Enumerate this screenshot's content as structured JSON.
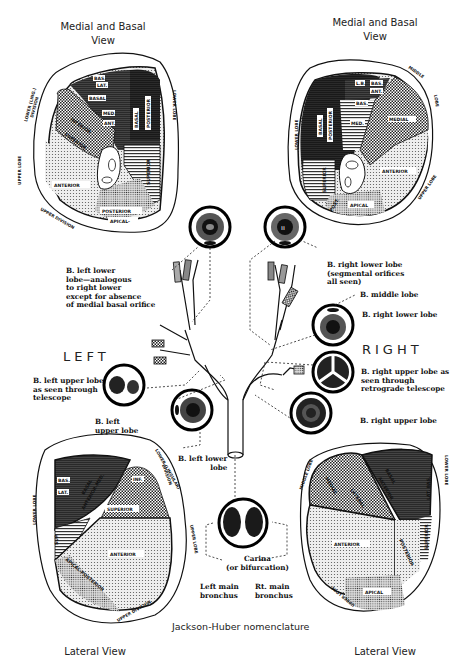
{
  "diagram": {
    "type": "anatomical-illustration",
    "nomenclature_label": "Jackson-Huber nomenclature",
    "sides": {
      "left": "LEFT",
      "right": "RIGHT"
    }
  },
  "panels": {
    "top_left": {
      "title_line1": "Medial and Basal",
      "title_line2": "View",
      "lobe_labels": [
        "LOWER (LING.) DIVISION",
        "UPPER LOBE",
        "LOWER LOBE",
        "UPPER DIVISION"
      ],
      "segments": [
        "BAS.",
        "LAT.",
        "BASAL",
        "MED.",
        "ANT.",
        "BASAL POSTERIOR",
        "INFERIOR",
        "SUPERIOR",
        "SUPERIOR",
        "ANTERIOR",
        "POSTERIOR",
        "APICAL-"
      ]
    },
    "top_right": {
      "title_line1": "Medial and Basal",
      "title_line2": "View",
      "lobe_labels": [
        "LOWER LOBE",
        "MIDDLE LOBE",
        "UPPER LOBE"
      ],
      "segments": [
        "L.B.",
        "BAS.",
        "ANT.",
        "BAS.",
        "MED.",
        "BASAL POSTERIOR",
        "MEDIAL",
        "SUPERIOR",
        "ANTERIOR",
        "POST.",
        "APICAL"
      ]
    },
    "bottom_left": {
      "title": "Lateral View",
      "lobe_labels": [
        "LOWER LOBE",
        "LOWER (LINGULAR) DIVISION",
        "UPPER LOBE",
        "UPPER DIVISION"
      ],
      "segments": [
        "BAS.",
        "LAT.",
        "BASAL ANTERIOR-MED.",
        "INF.",
        "SUPERIOR",
        "SUP.",
        "ANTERIOR",
        "APICAL-POSTERIOR"
      ]
    },
    "bottom_right": {
      "title": "Lateral View",
      "lobe_labels": [
        "MIDDLE LOBE",
        "LOWER LOBE",
        "UPPER LOBE"
      ],
      "segments": [
        "MEDIAL",
        "LATERAL",
        "BASAL ANTERIOR",
        "LAT. BAS.",
        "SUPERIOR",
        "ANTERIOR",
        "POSTERIOR",
        "APICAL"
      ]
    }
  },
  "captions": {
    "left_lower": [
      "B. left lower",
      "lobe—analogous",
      "to right lower",
      "except for absence",
      "of medial basal orifice"
    ],
    "right_lower_top": [
      "B. right lower lobe",
      "(segmental orifices",
      "all seen)"
    ],
    "middle_lobe": "B. middle lobe",
    "right_lower": "B. right lower lobe",
    "right_upper_retro": [
      "B. right upper lobe as",
      "seen through",
      "retrograde telescope"
    ],
    "left_upper_telescope": [
      "B. left upper lobe",
      "as seen through",
      "telescope"
    ],
    "left_upper": [
      "B. left",
      "upper lobe"
    ],
    "right_upper": "B. right upper lobe",
    "left_lower_small": [
      "B. left lower",
      "lobe"
    ],
    "carina": [
      "Carina",
      "(or bifurcation)"
    ],
    "left_main": [
      "Left main",
      "bronchus"
    ],
    "right_main": [
      "Rt. main",
      "bronchus"
    ]
  }
}
